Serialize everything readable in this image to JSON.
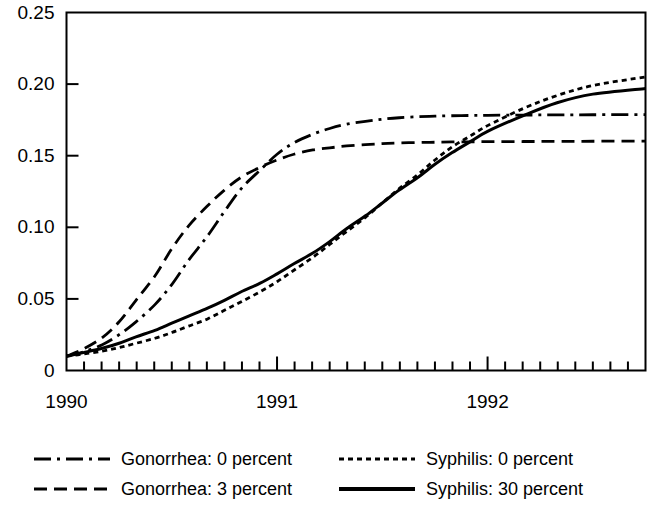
{
  "chart_data": {
    "type": "line",
    "title": "",
    "subtitle": "",
    "xlabel": "",
    "ylabel": "",
    "grid": false,
    "xlim": [
      1990.0,
      1992.75
    ],
    "ylim": [
      0,
      0.25
    ],
    "y_ticks": [
      0,
      0.05,
      0.1,
      0.15,
      0.2,
      0.25
    ],
    "y_tick_labels": [
      "0",
      "0.05",
      "0.10",
      "0.15",
      "0.20",
      "0.25"
    ],
    "x_ticks": [
      1990,
      1991,
      1992
    ],
    "x_tick_labels": [
      "1990",
      "1991",
      "1992"
    ],
    "x_minor_tick_interval_years": 0.08333,
    "legend_position": "below-plot-two-columns",
    "series": [
      {
        "name": "Gonorrhea: 0 percent",
        "style": "dash-dot",
        "x": [
          1990.0,
          1990.08,
          1990.17,
          1990.25,
          1990.33,
          1990.42,
          1990.5,
          1990.58,
          1990.67,
          1990.75,
          1990.83,
          1990.92,
          1991.0,
          1991.08,
          1991.17,
          1991.25,
          1991.33,
          1991.42,
          1991.5,
          1991.58,
          1991.67,
          1991.75,
          1991.83,
          1991.92,
          1992.0,
          1992.17,
          1992.33,
          1992.5,
          1992.75
        ],
        "values": [
          0.01,
          0.013,
          0.018,
          0.025,
          0.034,
          0.046,
          0.06,
          0.077,
          0.094,
          0.111,
          0.127,
          0.14,
          0.151,
          0.159,
          0.165,
          0.169,
          0.172,
          0.174,
          0.1755,
          0.1765,
          0.1772,
          0.1776,
          0.1779,
          0.1781,
          0.1782,
          0.1784,
          0.1785,
          0.1786,
          0.1787
        ]
      },
      {
        "name": "Gonorrhea: 3 percent",
        "style": "dashed",
        "x": [
          1990.0,
          1990.08,
          1990.17,
          1990.25,
          1990.33,
          1990.42,
          1990.5,
          1990.58,
          1990.67,
          1990.75,
          1990.83,
          1990.92,
          1991.0,
          1991.08,
          1991.17,
          1991.25,
          1991.33,
          1991.42,
          1991.5,
          1991.58,
          1991.67,
          1991.75,
          1991.83,
          1991.92,
          1992.0,
          1992.17,
          1992.33,
          1992.5,
          1992.75
        ],
        "values": [
          0.01,
          0.015,
          0.023,
          0.034,
          0.049,
          0.066,
          0.085,
          0.101,
          0.115,
          0.126,
          0.135,
          0.142,
          0.147,
          0.151,
          0.154,
          0.1555,
          0.1568,
          0.1578,
          0.1584,
          0.1589,
          0.1592,
          0.1594,
          0.1596,
          0.1597,
          0.1598,
          0.1599,
          0.16,
          0.1601,
          0.1602
        ]
      },
      {
        "name": "Syphilis: 0 percent",
        "style": "dotted",
        "x": [
          1990.0,
          1990.08,
          1990.17,
          1990.25,
          1990.33,
          1990.42,
          1990.5,
          1990.58,
          1990.67,
          1990.75,
          1990.83,
          1990.92,
          1991.0,
          1991.08,
          1991.17,
          1991.25,
          1991.33,
          1991.42,
          1991.5,
          1991.58,
          1991.67,
          1991.75,
          1991.83,
          1991.92,
          1992.0,
          1992.17,
          1992.33,
          1992.5,
          1992.75
        ],
        "values": [
          0.01,
          0.0115,
          0.0135,
          0.016,
          0.019,
          0.0225,
          0.0265,
          0.031,
          0.036,
          0.042,
          0.048,
          0.055,
          0.062,
          0.07,
          0.079,
          0.088,
          0.097,
          0.107,
          0.117,
          0.127,
          0.137,
          0.147,
          0.156,
          0.164,
          0.171,
          0.183,
          0.192,
          0.199,
          0.205
        ]
      },
      {
        "name": "Syphilis: 30 percent",
        "style": "solid",
        "x": [
          1990.0,
          1990.08,
          1990.17,
          1990.25,
          1990.33,
          1990.42,
          1990.5,
          1990.58,
          1990.67,
          1990.75,
          1990.83,
          1990.92,
          1991.0,
          1991.08,
          1991.17,
          1991.25,
          1991.33,
          1991.42,
          1991.5,
          1991.58,
          1991.67,
          1991.75,
          1991.83,
          1991.92,
          1992.0,
          1992.17,
          1992.33,
          1992.5,
          1992.75
        ],
        "values": [
          0.01,
          0.0125,
          0.0155,
          0.019,
          0.0235,
          0.028,
          0.033,
          0.038,
          0.0435,
          0.049,
          0.055,
          0.061,
          0.0675,
          0.0745,
          0.082,
          0.09,
          0.099,
          0.108,
          0.117,
          0.126,
          0.135,
          0.144,
          0.152,
          0.16,
          0.167,
          0.178,
          0.187,
          0.193,
          0.197
        ]
      }
    ]
  },
  "legend": {
    "items": [
      {
        "label": "Gonorrhea: 0 percent",
        "style": "dash-dot"
      },
      {
        "label": "Syphilis: 0 percent",
        "style": "dotted"
      },
      {
        "label": "Gonorrhea: 3 percent",
        "style": "dashed"
      },
      {
        "label": "Syphilis: 30 percent",
        "style": "solid"
      }
    ]
  },
  "colors": {
    "line": "#000000",
    "axis": "#000000",
    "background": "#ffffff"
  }
}
